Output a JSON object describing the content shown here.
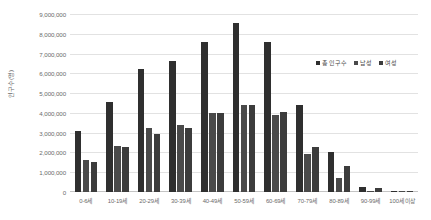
{
  "chart_data": {
    "type": "bar",
    "title": "",
    "subtitle": "",
    "xlabel": "",
    "ylabel": "인구수(명)",
    "ylim": [
      0,
      9000000
    ],
    "ytick_labels": [
      "9,000,000",
      "8,000,000",
      "7,000,000",
      "6,000,000",
      "5,000,000",
      "4,000,000",
      "3,000,000",
      "2,000,000",
      "1,000,000",
      "0"
    ],
    "ytick_values": [
      9000000,
      8000000,
      7000000,
      6000000,
      5000000,
      4000000,
      3000000,
      2000000,
      1000000,
      0
    ],
    "grid": true,
    "legend_position": "top-right",
    "categories": [
      "0-6세",
      "10-19세",
      "20-29세",
      "30-39세",
      "40-49세",
      "50-59세",
      "60-69세",
      "70-79세",
      "80-89세",
      "90-99세",
      "100세 이상"
    ],
    "series": [
      {
        "name": "총 인구수",
        "color": "#2f2f2f",
        "values": [
          3100000,
          4550000,
          6200000,
          6600000,
          7600000,
          8550000,
          7600000,
          4400000,
          2000000,
          260000,
          20000
        ]
      },
      {
        "name": "남성",
        "color": "#4a4a4a",
        "values": [
          1600000,
          2350000,
          3250000,
          3400000,
          4000000,
          4400000,
          3900000,
          1900000,
          700000,
          60000,
          5000
        ]
      },
      {
        "name": "여성",
        "color": "#3c3c3c",
        "values": [
          1500000,
          2300000,
          2950000,
          3250000,
          4000000,
          4400000,
          4050000,
          2300000,
          1300000,
          200000,
          15000
        ]
      }
    ]
  },
  "legend": {
    "items": [
      {
        "label": "총 인구수",
        "color": "#2f2f2f"
      },
      {
        "label": "남성",
        "color": "#4a4a4a"
      },
      {
        "label": "여성",
        "color": "#3c3c3c"
      }
    ]
  }
}
